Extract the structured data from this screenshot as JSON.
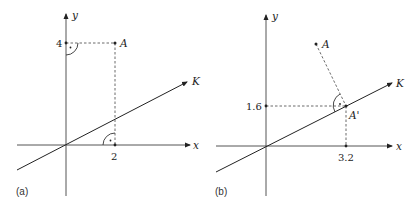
{
  "panels": [
    {
      "id": "a",
      "caption": "(a)",
      "axes": {
        "x_label": "x",
        "y_label": "y"
      },
      "line_label": "K",
      "point_label": "A",
      "x_tick": "2",
      "y_tick": "4",
      "point": {
        "x": 2,
        "y": 4
      }
    },
    {
      "id": "b",
      "caption": "(b)",
      "axes": {
        "x_label": "x",
        "y_label": "y"
      },
      "line_label": "K",
      "point_label": "A",
      "projection_label": "A'",
      "x_tick": "3.2",
      "y_tick": "1.6",
      "projection": {
        "x": 3.2,
        "y": 1.6
      }
    }
  ]
}
